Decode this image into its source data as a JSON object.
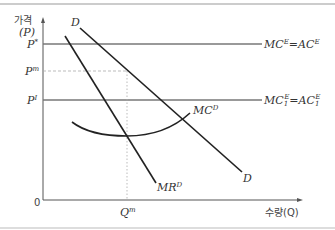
{
  "diagram": {
    "y_axis": {
      "label_line1": "가격",
      "label_line2": "(P)"
    },
    "x_axis": {
      "label": "수량(Q)",
      "origin": "0"
    },
    "price_labels": {
      "p_star": {
        "base": "P",
        "sup": "*"
      },
      "p_m": {
        "base": "P",
        "sup": "m"
      },
      "p_i": {
        "base": "P",
        "sup": "I"
      }
    },
    "quantity_labels": {
      "q_m": {
        "base": "Q",
        "sup": "m"
      }
    },
    "curves": {
      "demand_top": "D",
      "demand_bottom": "D",
      "mr": {
        "base": "MR",
        "sup": "D"
      },
      "mc": {
        "base": "MC",
        "sup": "D"
      },
      "mc_e": {
        "left": "MC",
        "left_sup": "E",
        "eq": "=",
        "right": "AC",
        "right_sup": "E"
      },
      "mc1_e": {
        "left": "MC",
        "left_sub": "1",
        "left_sup": "E",
        "eq": "=",
        "right": "AC",
        "right_sub": "1",
        "right_sup": "E"
      }
    },
    "colors": {
      "axis": "#555555",
      "curve": "#222222",
      "hline": "#777777",
      "guide": "#aaaaaa",
      "border": "#999999"
    }
  }
}
